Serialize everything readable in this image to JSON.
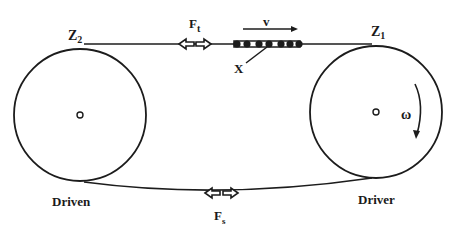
{
  "diagram": {
    "type": "chain-drive",
    "colors": {
      "ink": "#1c1c1c",
      "background": "#ffffff"
    },
    "sprockets": {
      "driven": {
        "label": "Driven",
        "tooth_label": "Z",
        "tooth_sub": "2",
        "cx": 80,
        "cy": 115,
        "r": 66
      },
      "driver": {
        "label": "Driver",
        "tooth_label": "Z",
        "tooth_sub": "1",
        "cx": 376,
        "cy": 112,
        "r": 66,
        "rotation_label": "ω"
      }
    },
    "forces": {
      "tight_side": {
        "label": "F",
        "sub": "t"
      },
      "slack_side": {
        "label": "F",
        "sub": "s"
      }
    },
    "chain": {
      "velocity_label": "v",
      "link_label": "X"
    }
  }
}
